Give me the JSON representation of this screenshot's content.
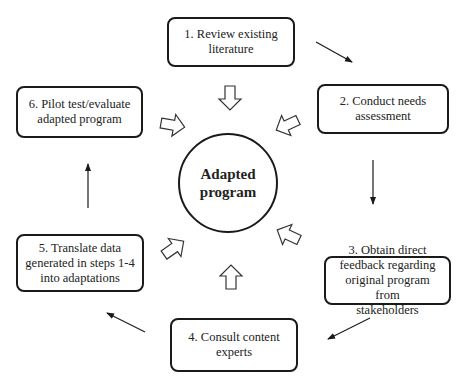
{
  "diagram": {
    "center": {
      "label_line1": "Adapted",
      "label_line2": "program"
    },
    "steps": [
      {
        "id": 1,
        "line1": "1. Review existing",
        "line2": "literature",
        "line3": "",
        "line4": ""
      },
      {
        "id": 2,
        "line1": "2. Conduct needs",
        "line2": "assessment",
        "line3": "",
        "line4": ""
      },
      {
        "id": 3,
        "line1": "3. Obtain direct",
        "line2": "feedback regarding",
        "line3": "original program from",
        "line4": "stakeholders"
      },
      {
        "id": 4,
        "line1": "4. Consult content",
        "line2": "experts",
        "line3": "",
        "line4": ""
      },
      {
        "id": 5,
        "line1": "5. Translate data",
        "line2": "generated in steps 1-4",
        "line3": "into adaptations",
        "line4": ""
      },
      {
        "id": 6,
        "line1": "6. Pilot test/evaluate",
        "line2": "adapted program",
        "line3": "",
        "line4": ""
      }
    ],
    "flow": [
      "1 -> 2",
      "2 -> 3",
      "3 -> 4",
      "4 -> 5",
      "5 -> 6"
    ],
    "inputs_to_center": [
      "1",
      "2",
      "3",
      "4",
      "5",
      "6"
    ],
    "colors": {
      "stroke": "#1a1a1a",
      "background": "#ffffff",
      "text": "#222222"
    }
  }
}
